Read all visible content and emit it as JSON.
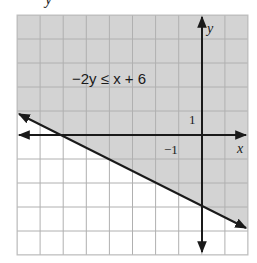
{
  "top_fragment": "y",
  "chart_data": {
    "type": "inequality-graph",
    "title": "",
    "inequality": "−2y ≤ x + 6",
    "boundary_line": {
      "equation": "y = -x/2 - 3",
      "style": "solid",
      "slope": -0.5,
      "y_intercept": -3,
      "x_intercept": -6,
      "points": [
        [
          -8,
          1
        ],
        [
          -6,
          0
        ],
        [
          0,
          -3
        ],
        [
          2,
          -4
        ]
      ]
    },
    "shaded_region": "above boundary line",
    "xlabel": "x",
    "ylabel": "y",
    "tick_labels": [
      {
        "axis": "y",
        "value": 1,
        "label": "1"
      },
      {
        "axis": "x",
        "value": -1,
        "label": "−1"
      }
    ],
    "xlim": [
      -8,
      2
    ],
    "ylim": [
      -5,
      5
    ],
    "grid": true,
    "colors": {
      "shade": "#d3d3d3",
      "shade_grid": "#a9a9a9",
      "grid": "#b3b3b3",
      "line": "#1a1a1a",
      "background": "#ffffff"
    }
  }
}
